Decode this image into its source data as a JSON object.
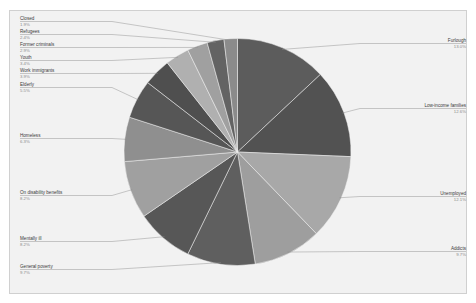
{
  "chart_data": {
    "type": "pie",
    "title": "",
    "subtitle": "",
    "xlabel": "",
    "ylabel": "",
    "legend_position": "none",
    "grid": false,
    "start_angle_deg": 0,
    "direction": "clockwise",
    "value_unit": "percent",
    "categories": [
      "Furlough",
      "Low-income families",
      "Unemployed",
      "Addicts",
      "General poverty",
      "Mentally ill",
      "On disability benefits",
      "Homeless",
      "Elderly",
      "Work immigrants",
      "Youth",
      "Former criminals",
      "Refugees",
      "Closed"
    ],
    "values": [
      13.0,
      12.6,
      12.1,
      9.7,
      9.7,
      8.2,
      8.2,
      6.3,
      5.5,
      3.9,
      3.4,
      2.9,
      2.4,
      1.9
    ],
    "labels": [
      {
        "name": "Furlough",
        "pct": "13.0%",
        "side": "right"
      },
      {
        "name": "Low-income families",
        "pct": "12.6%",
        "side": "right"
      },
      {
        "name": "Unemployed",
        "pct": "12.1%",
        "side": "right"
      },
      {
        "name": "Addicts",
        "pct": "9.7%",
        "side": "right"
      },
      {
        "name": "General poverty",
        "pct": "9.7%",
        "side": "left"
      },
      {
        "name": "Mentally ill",
        "pct": "8.2%",
        "side": "left"
      },
      {
        "name": "On disability benefits",
        "pct": "8.2%",
        "side": "left"
      },
      {
        "name": "Homeless",
        "pct": "6.3%",
        "side": "left"
      },
      {
        "name": "Elderly",
        "pct": "5.5%",
        "side": "left"
      },
      {
        "name": "Work immigrants",
        "pct": "3.9%",
        "side": "left"
      },
      {
        "name": "Youth",
        "pct": "3.4%",
        "side": "left"
      },
      {
        "name": "Former criminals",
        "pct": "2.9%",
        "side": "left"
      },
      {
        "name": "Refugees",
        "pct": "2.4%",
        "side": "left"
      },
      {
        "name": "Closed",
        "pct": "1.9%",
        "side": "left"
      }
    ],
    "colors": {
      "dark": "#5c5c5c",
      "light": "#a8a8a8",
      "background": "#f2f2f2",
      "frame_border": "#d0d0d0",
      "label_text": "#3a3a3a",
      "percent_text": "#8c8c8c",
      "leader_line": "#8a8a8a",
      "slice_separator": "#f2f2f2"
    },
    "slice_colors": [
      "#5c5c5c",
      "#525252",
      "#a8a8a8",
      "#9e9e9e",
      "#5f5f5f",
      "#575757",
      "#a0a0a0",
      "#8f8f8f",
      "#565656",
      "#4f4f4f",
      "#b0b0b0",
      "#a0a0a0",
      "#636363",
      "#8b8b8b"
    ]
  }
}
